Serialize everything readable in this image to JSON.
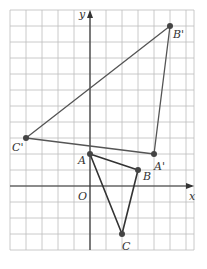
{
  "diagram": {
    "grid": {
      "x_min": -5,
      "x_max": 6.5,
      "y_min": -4,
      "y_max": 11,
      "unit_px": 16,
      "origin_px": [
        90,
        186
      ],
      "left_px": 10,
      "top_px": 10,
      "right_px": 194,
      "bottom_px": 250,
      "line_color": "#bdbdbd",
      "axis_color": "#333333"
    },
    "axes": {
      "x_label": "x",
      "y_label": "y",
      "origin_label": "O"
    },
    "triangles": [
      {
        "name": "ABC",
        "color": "#333333",
        "stroke_width": 1.6,
        "vertices": [
          {
            "label": "A",
            "x": 0,
            "y": 2,
            "label_dx": -12,
            "label_dy": 10
          },
          {
            "label": "B",
            "x": 3,
            "y": 1,
            "label_dx": 5,
            "label_dy": 10
          },
          {
            "label": "C",
            "x": 2,
            "y": -3,
            "label_dx": 0,
            "label_dy": 16
          }
        ]
      },
      {
        "name": "A'B'C'",
        "color": "#555555",
        "stroke_width": 1.3,
        "vertices": [
          {
            "label": "A'",
            "x": 4,
            "y": 2,
            "label_dx": 0,
            "label_dy": 16
          },
          {
            "label": "B'",
            "x": 5,
            "y": 10,
            "label_dx": 3,
            "label_dy": 12
          },
          {
            "label": "C'",
            "x": -4,
            "y": 3,
            "label_dx": -14,
            "label_dy": 13
          }
        ]
      }
    ],
    "point_color": "#444444",
    "point_radius": 3
  }
}
